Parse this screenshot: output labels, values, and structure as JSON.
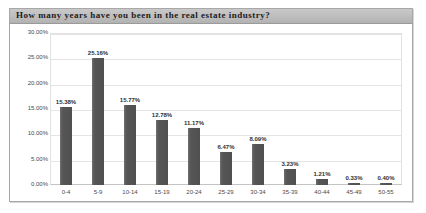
{
  "title": "How many years have you been in the real estate industry?",
  "chart_data": {
    "type": "bar",
    "title": "How many years have you been in the real estate industry?",
    "xlabel": "",
    "ylabel": "",
    "categories": [
      "0-4",
      "5-9",
      "10-14",
      "15-19",
      "20-24",
      "25-29",
      "30-34",
      "35-39",
      "40-44",
      "45-49",
      "50-55"
    ],
    "values": [
      15.38,
      25.16,
      15.77,
      12.78,
      11.17,
      6.47,
      8.09,
      3.23,
      1.21,
      0.33,
      0.4
    ],
    "value_labels": [
      "15.38%",
      "25.16%",
      "15.77%",
      "12.78%",
      "11.17%",
      "6.47%",
      "8.09%",
      "3.23%",
      "1.21%",
      "0.33%",
      "0.40%"
    ],
    "ylim": [
      0,
      30
    ],
    "ytick_labels": [
      "0.00%",
      "5.00%",
      "10.00%",
      "15.00%",
      "20.00%",
      "25.00%",
      "30.00%"
    ],
    "ytick_values": [
      0,
      5,
      10,
      15,
      20,
      25,
      30
    ],
    "grid": true,
    "legend": false,
    "bar_color": "#565656",
    "gridline_color": "#e4e4e4"
  }
}
